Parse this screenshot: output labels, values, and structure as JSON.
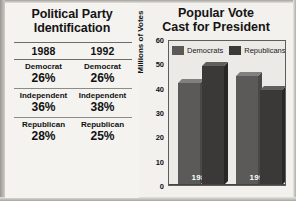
{
  "figure": {
    "background_color": "#f2f1ee",
    "ink_color": "#141414"
  },
  "left_panel": {
    "title_line1": "Political Party",
    "title_line2": "Identification",
    "columns": [
      "1988",
      "1992"
    ],
    "rows": [
      {
        "party": "Democrat",
        "values": [
          "26%",
          "26%"
        ]
      },
      {
        "party": "Independent",
        "values": [
          "36%",
          "38%"
        ]
      },
      {
        "party": "Republican",
        "values": [
          "28%",
          "25%"
        ]
      }
    ],
    "cells": {
      "c0_party": "Democrat",
      "c0_v0": "26%",
      "c0_v1": "26%",
      "c1_party": "Independent",
      "c1_v0": "36%",
      "c1_v1": "38%",
      "c2_party": "Republican",
      "c2_v0": "28%",
      "c2_v1": "25%"
    }
  },
  "right_panel": {
    "title_line1": "Popular Vote",
    "title_line2": "Cast for President"
  },
  "chart_data": {
    "type": "bar",
    "title": "Popular Vote Cast for President",
    "xlabel": "",
    "ylabel": "Millions of Votes",
    "categories": [
      "1988",
      "1992"
    ],
    "ylim": [
      0,
      60
    ],
    "yticks": [
      "60",
      "50",
      "40",
      "30",
      "20",
      "10",
      "0"
    ],
    "ytick_values": [
      60,
      50,
      40,
      30,
      20,
      10,
      0
    ],
    "grid": false,
    "legend_position": "top-left-inside",
    "series": [
      {
        "name": "Democrats",
        "color": "#5b5a58",
        "values": [
          42,
          45
        ]
      },
      {
        "name": "Republicans",
        "color": "#3a3937",
        "values": [
          49,
          39
        ]
      }
    ],
    "bar_style": "3d-extruded",
    "annotations": [
      {
        "text": "1988",
        "location": "inside-bar-group-1-bottom",
        "color": "#ffffff"
      },
      {
        "text": "1992",
        "location": "inside-bar-group-2-bottom",
        "color": "#ffffff"
      }
    ]
  }
}
